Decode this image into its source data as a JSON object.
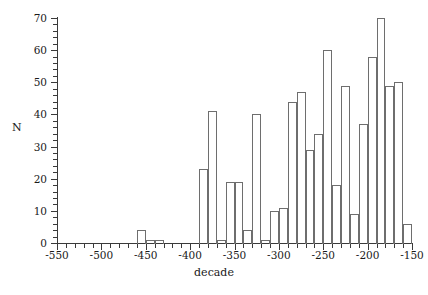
{
  "chart_data": {
    "type": "bar",
    "title": "",
    "subtitle": "",
    "xlabel": "decade",
    "ylabel": "N",
    "xlim": [
      -550,
      -150
    ],
    "ylim": [
      0,
      70
    ],
    "grid": false,
    "legend": null,
    "bin_width": 10,
    "x_major_ticks": [
      -550,
      -500,
      -450,
      -400,
      -350,
      -300,
      -250,
      -200,
      -150
    ],
    "x_tick_labels": [
      "-550",
      "-500",
      "-450",
      "-400",
      "-350",
      "-300",
      "-250",
      "-200",
      "-150"
    ],
    "x_minor_tick_step": 10,
    "y_major_ticks": [
      0,
      10,
      20,
      30,
      40,
      50,
      60,
      70
    ],
    "y_tick_labels": [
      "0",
      "10",
      "20",
      "30",
      "40",
      "50",
      "60",
      "70"
    ],
    "y_minor_tick_step": 2,
    "categories": [
      -460,
      -450,
      -440,
      -390,
      -380,
      -370,
      -360,
      -350,
      -340,
      -330,
      -320,
      -310,
      -300,
      -290,
      -280,
      -270,
      -260,
      -250,
      -240,
      -230,
      -220,
      -210,
      -200,
      -190,
      -180,
      -170,
      -160
    ],
    "values": [
      4,
      1,
      1,
      23,
      41,
      1,
      19,
      19,
      4,
      40,
      1,
      10,
      11,
      44,
      47,
      29,
      34,
      60,
      18,
      49,
      9,
      37,
      58,
      70,
      49,
      50,
      6
    ],
    "bars": [
      {
        "decade": -460,
        "value": 4
      },
      {
        "decade": -450,
        "value": 1
      },
      {
        "decade": -440,
        "value": 1
      },
      {
        "decade": -390,
        "value": 23
      },
      {
        "decade": -380,
        "value": 41
      },
      {
        "decade": -370,
        "value": 1
      },
      {
        "decade": -360,
        "value": 19
      },
      {
        "decade": -350,
        "value": 19
      },
      {
        "decade": -340,
        "value": 4
      },
      {
        "decade": -330,
        "value": 40
      },
      {
        "decade": -320,
        "value": 1
      },
      {
        "decade": -310,
        "value": 10
      },
      {
        "decade": -300,
        "value": 11
      },
      {
        "decade": -290,
        "value": 44
      },
      {
        "decade": -280,
        "value": 47
      },
      {
        "decade": -270,
        "value": 29
      },
      {
        "decade": -260,
        "value": 34
      },
      {
        "decade": -250,
        "value": 60
      },
      {
        "decade": -240,
        "value": 18
      },
      {
        "decade": -230,
        "value": 49
      },
      {
        "decade": -220,
        "value": 9
      },
      {
        "decade": -210,
        "value": 37
      },
      {
        "decade": -200,
        "value": 58
      },
      {
        "decade": -190,
        "value": 70
      },
      {
        "decade": -180,
        "value": 49
      },
      {
        "decade": -170,
        "value": 50
      },
      {
        "decade": -160,
        "value": 6
      }
    ],
    "colors": {
      "bar_stroke": "#6e6e6e",
      "bar_fill": "transparent",
      "axis": "#3a3a3a",
      "text": "#1a1a1a",
      "background": "#ffffff"
    }
  }
}
